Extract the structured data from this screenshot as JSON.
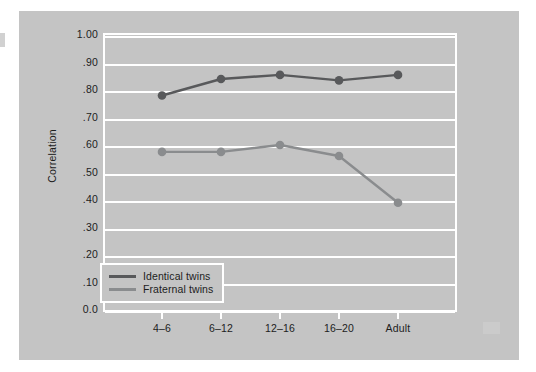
{
  "figure": {
    "background_color": "#ffffff",
    "panel_color": "#c4c4c4",
    "plot_border_color": "#ffffff",
    "gridline_color": "#ffffff"
  },
  "chart_data": {
    "type": "line",
    "title": "",
    "xlabel": "",
    "ylabel": "Correlation",
    "categories": [
      "4–6",
      "6–12",
      "12–16",
      "16–20",
      "Adult"
    ],
    "ylim": [
      0.0,
      1.0
    ],
    "yticks": [
      0.0,
      0.1,
      0.2,
      0.3,
      0.4,
      0.5,
      0.6,
      0.7,
      0.8,
      0.9,
      1.0
    ],
    "ytick_labels": [
      "0.0",
      ".10",
      ".20",
      ".30",
      ".40",
      ".50",
      ".60",
      ".70",
      ".80",
      ".90",
      "1.00"
    ],
    "grid": true,
    "legend_position": "lower left",
    "series": [
      {
        "name": "Identical twins",
        "color": "#58595b",
        "marker": "circle",
        "values": [
          0.78,
          0.84,
          0.855,
          0.835,
          0.855
        ]
      },
      {
        "name": "Fraternal twins",
        "color": "#8a8c8e",
        "marker": "circle",
        "values": [
          0.575,
          0.575,
          0.6,
          0.56,
          0.39
        ]
      }
    ]
  },
  "legend": {
    "entries": [
      {
        "label": "Identical twins",
        "color": "#58595b"
      },
      {
        "label": "Fraternal twins",
        "color": "#8a8c8e"
      }
    ]
  }
}
